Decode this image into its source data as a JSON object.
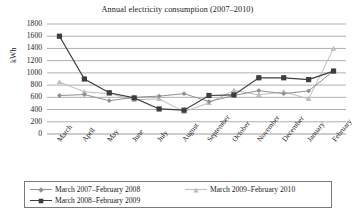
{
  "chart_data": {
    "type": "line",
    "title": "Annual electricity consumption (2007–2010)",
    "xlabel": "",
    "ylabel": "kWh",
    "categories": [
      "March",
      "April",
      "May",
      "June",
      "July",
      "August",
      "September",
      "October",
      "November",
      "December",
      "January",
      "February"
    ],
    "ylim": [
      0,
      1800
    ],
    "ytick_step": 200,
    "yticks": [
      1800,
      1600,
      1400,
      1200,
      1000,
      800,
      600,
      400,
      200,
      0
    ],
    "grid": "horizontal",
    "legend_position": "bottom",
    "series": [
      {
        "name": "March 2007–February 2008",
        "color": "#8f8f8f",
        "marker": "diamond",
        "values": [
          630,
          645,
          545,
          600,
          620,
          660,
          530,
          630,
          710,
          660,
          705,
          1030
        ]
      },
      {
        "name": "March 2008–February 2009",
        "color": "#3d3d3d",
        "marker": "square",
        "values": [
          1600,
          900,
          675,
          590,
          410,
          390,
          630,
          640,
          920,
          920,
          890,
          1030
        ]
      },
      {
        "name": "March 2009–February 2010",
        "color": "#bdbdbd",
        "marker": "triangle",
        "values": [
          850,
          690,
          660,
          560,
          575,
          365,
          510,
          715,
          640,
          690,
          575,
          1400
        ]
      }
    ]
  },
  "axis": {
    "y_title": "kWh"
  }
}
